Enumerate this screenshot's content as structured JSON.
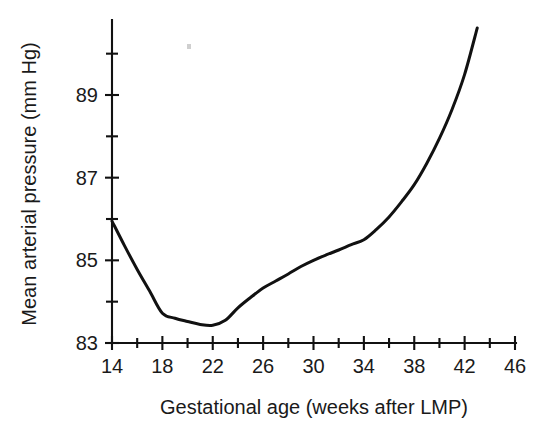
{
  "chart_data": {
    "type": "line",
    "title": "",
    "xlabel": "Gestational age (weeks after LMP)",
    "ylabel": "Mean arterial pressure (mm Hg)",
    "xlim": [
      14,
      46
    ],
    "ylim": [
      83,
      90.9
    ],
    "grid": false,
    "legend": null,
    "x_ticks": [
      14,
      18,
      22,
      26,
      30,
      34,
      38,
      42,
      46
    ],
    "x_tick_labels": [
      "14",
      "18",
      "22",
      "26",
      "30",
      "34",
      "38",
      "42",
      "46"
    ],
    "x_minor_step": 2,
    "y_ticks": [
      83,
      85,
      87,
      89
    ],
    "y_tick_labels": [
      "83",
      "85",
      "87",
      "89"
    ],
    "y_minor_ticks": [
      84,
      86,
      88,
      90
    ],
    "series": [
      {
        "name": "Mean arterial pressure",
        "color": "#111111",
        "x": [
          14,
          15,
          16,
          17,
          18,
          19,
          20,
          21,
          22,
          23,
          24,
          25,
          26,
          27,
          28,
          29,
          30,
          31,
          32,
          33,
          34,
          35,
          36,
          37,
          38,
          39,
          40,
          41,
          42,
          43
        ],
        "y": [
          85.95,
          85.35,
          84.78,
          84.25,
          83.72,
          83.6,
          83.52,
          83.45,
          83.43,
          83.55,
          83.85,
          84.1,
          84.33,
          84.5,
          84.67,
          84.85,
          85.0,
          85.13,
          85.25,
          85.38,
          85.5,
          85.75,
          86.05,
          86.42,
          86.83,
          87.35,
          87.95,
          88.65,
          89.5,
          90.62
        ]
      }
    ]
  },
  "labels": {
    "y_axis_title": "Mean arterial pressure (mm Hg)",
    "x_axis_title": "Gestational age (weeks after LMP)"
  }
}
